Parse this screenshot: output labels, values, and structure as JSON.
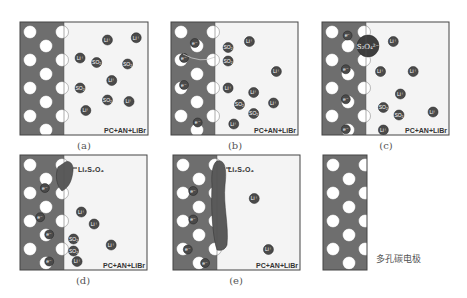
{
  "colors": {
    "electrode": "#6e6e6e",
    "electrolyte": "#f4f4f4",
    "pore": "#ffffff",
    "ion": "#4a4a4a",
    "product": "#5a5a5a",
    "border": "#444444"
  },
  "panels": [
    {
      "id": "a",
      "caption": "(a)",
      "solution_label": "PC+AN+LiBr",
      "ions": [
        {
          "label": "Li⁺",
          "pos": [
            0.52,
            0.16
          ]
        },
        {
          "label": "Li⁺",
          "pos": [
            0.92,
            0.13
          ]
        },
        {
          "label": "Li⁺",
          "pos": [
            0.14,
            0.4
          ]
        },
        {
          "label": "SO₂",
          "pos": [
            0.37,
            0.46
          ]
        },
        {
          "label": "SO₂",
          "pos": [
            0.8,
            0.48
          ]
        },
        {
          "label": "Li⁺",
          "pos": [
            0.58,
            0.7
          ]
        },
        {
          "label": "SO₂",
          "pos": [
            0.14,
            0.8
          ]
        },
        {
          "label": "SO₂",
          "pos": [
            0.52,
            0.96
          ]
        },
        {
          "label": "Li⁺",
          "pos": [
            0.82,
            0.98
          ]
        },
        {
          "label": "Li⁺",
          "pos": [
            0.22,
            1.1
          ]
        }
      ],
      "electrons": [],
      "product": null
    },
    {
      "id": "b",
      "caption": "(b)",
      "solution_label": "PC+AN+LiBr",
      "ions": [
        {
          "label": "SO₂",
          "pos": [
            0.1,
            0.26
          ]
        },
        {
          "label": "SO₂",
          "pos": [
            0.1,
            0.44
          ]
        },
        {
          "label": "Li⁺",
          "pos": [
            0.4,
            0.18
          ]
        },
        {
          "label": "Li⁺",
          "pos": [
            0.78,
            0.58
          ]
        },
        {
          "label": "Li⁺",
          "pos": [
            0.1,
            0.8
          ]
        },
        {
          "label": "Li⁺",
          "pos": [
            0.46,
            0.86
          ]
        },
        {
          "label": "SO₂",
          "pos": [
            0.26,
            1.02
          ]
        },
        {
          "label": "Li⁺",
          "pos": [
            0.74,
            1.0
          ]
        },
        {
          "label": "SO₂",
          "pos": [
            0.46,
            1.14
          ]
        },
        {
          "label": "Li⁺",
          "pos": [
            0.18,
            1.28
          ]
        }
      ],
      "electrons": [
        {
          "label": "e⁻",
          "pos": [
            0.55,
            0.2
          ]
        },
        {
          "label": "e⁻",
          "pos": [
            0.25,
            0.4
          ]
        },
        {
          "label": "e⁻",
          "pos": [
            0.25,
            0.76
          ]
        },
        {
          "label": "e⁻",
          "pos": [
            0.63,
            1.26
          ]
        }
      ],
      "product": null
    },
    {
      "id": "c",
      "caption": "(c)",
      "solution_label": "PC+AN+LiBr",
      "big_ion": {
        "label": "S₂O₄²⁻"
      },
      "ions": [
        {
          "label": "Li⁺",
          "pos": [
            0.3,
            0.18
          ]
        },
        {
          "label": "Li⁺",
          "pos": [
            0.12,
            0.58
          ]
        },
        {
          "label": "Li⁺",
          "pos": [
            0.58,
            0.58
          ]
        },
        {
          "label": "Li⁺",
          "pos": [
            0.4,
            0.88
          ]
        },
        {
          "label": "SO₂",
          "pos": [
            0.16,
            1.06
          ]
        },
        {
          "label": "SO₂",
          "pos": [
            0.38,
            1.16
          ]
        },
        {
          "label": "Li⁺",
          "pos": [
            0.86,
            1.12
          ]
        },
        {
          "label": "Li⁺",
          "pos": [
            0.16,
            1.36
          ]
        }
      ],
      "electrons": [
        {
          "label": "e⁻",
          "pos": [
            0.6,
            0.1
          ]
        },
        {
          "label": "e⁻",
          "pos": [
            0.55,
            0.55
          ]
        },
        {
          "label": "e⁻",
          "pos": [
            0.55,
            0.95
          ]
        },
        {
          "label": "e⁻",
          "pos": [
            0.55,
            1.35
          ]
        }
      ],
      "product": null
    },
    {
      "id": "d",
      "caption": "(d)",
      "solution_label": "PC+AN+LiBr",
      "product_label": "Li₂S₂O₄",
      "ions": [
        {
          "label": "Li⁺",
          "pos": [
            0.16,
            0.68
          ]
        },
        {
          "label": "Li⁺",
          "pos": [
            0.34,
            0.84
          ]
        },
        {
          "label": "SO₂",
          "pos": [
            0.05,
            1.04
          ]
        },
        {
          "label": "SO₂",
          "pos": [
            0.05,
            1.2
          ]
        },
        {
          "label": "Li⁺",
          "pos": [
            0.1,
            1.34
          ]
        },
        {
          "label": "Li⁺",
          "pos": [
            0.58,
            1.12
          ]
        }
      ],
      "electrons": [
        {
          "label": "e⁻",
          "pos": [
            0.58,
            0.36
          ]
        },
        {
          "label": "e⁻",
          "pos": [
            0.45,
            0.75
          ]
        },
        {
          "label": "e⁻",
          "pos": [
            0.7,
            0.98
          ]
        },
        {
          "label": "e⁻",
          "pos": [
            0.7,
            1.34
          ]
        }
      ]
    },
    {
      "id": "e",
      "caption": "(e)",
      "solution_label": "PC+AN+LiBr",
      "product_label": "Li₂S₂O₄",
      "ions": [
        {
          "label": "Li⁺",
          "pos": [
            0.44,
            0.5
          ]
        },
        {
          "label": "Li⁺",
          "pos": [
            0.64,
            1.18
          ]
        }
      ],
      "electrons": [
        {
          "label": "e⁻",
          "pos": [
            0.45,
            0.4
          ]
        },
        {
          "label": "e⁻",
          "pos": [
            0.45,
            0.78
          ]
        },
        {
          "label": "e⁻",
          "pos": [
            0.3,
            1.18
          ]
        },
        {
          "label": "e⁻",
          "pos": [
            0.78,
            1.36
          ]
        }
      ]
    }
  ],
  "legend": {
    "label": "多孔碳电极"
  }
}
